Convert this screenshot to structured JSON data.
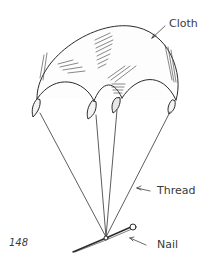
{
  "figure": {
    "labels": {
      "cloth": "Cloth",
      "thread": "Thread",
      "nail": "Nail"
    },
    "page_number": "148"
  }
}
